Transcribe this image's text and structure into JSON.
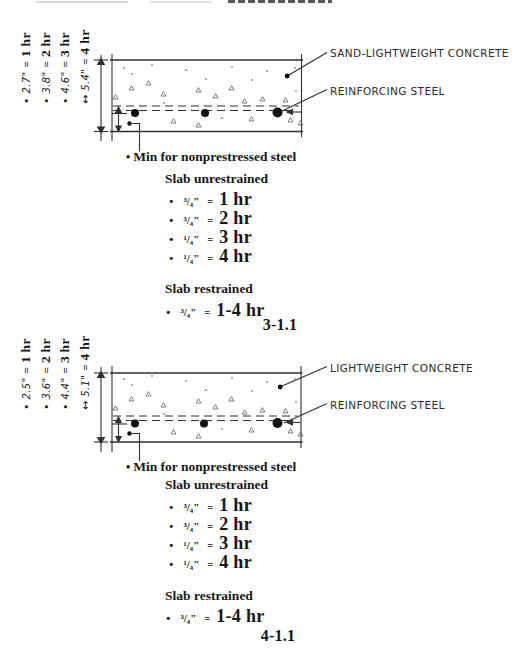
{
  "symbols": {
    "equals": "=",
    "bullet": "•"
  },
  "figures": [
    {
      "material_label": "SAND-LIGHTWEIGHT CONCRETE",
      "steel_label": "REINFORCING STEEL",
      "thickness_ratings": [
        {
          "bullet": "•",
          "value": "2.7\"",
          "rating": "1 hr"
        },
        {
          "bullet": "•",
          "value": "3.8\"",
          "rating": "2 hr"
        },
        {
          "bullet": "•",
          "value": "4.6\"",
          "rating": "3 hr"
        },
        {
          "bullet": "↔",
          "value": "5.4\"",
          "rating": "4 hr"
        }
      ],
      "cover_note": "Min for nonprestressed steel",
      "unrestrained_heading": "Slab unrestrained",
      "unrestrained_items": [
        {
          "cover": "³/₄\"",
          "rating": "1 hr"
        },
        {
          "cover": "³/₄\"",
          "rating": "2 hr"
        },
        {
          "cover": "¹/₄\"",
          "rating": "3 hr"
        },
        {
          "cover": "¹/₄\"",
          "rating": "4 hr"
        }
      ],
      "restrained_heading": "Slab restrained",
      "restrained_items": [
        {
          "cover": "³/₄\"",
          "rating": "1-4 hr"
        }
      ],
      "figure_number": "3-1.1"
    },
    {
      "material_label": "LIGHTWEIGHT CONCRETE",
      "steel_label": "REINFORCING STEEL",
      "thickness_ratings": [
        {
          "bullet": "•",
          "value": "2.5\"",
          "rating": "1 hr"
        },
        {
          "bullet": "•",
          "value": "3.6\"",
          "rating": "2 hr"
        },
        {
          "bullet": "•",
          "value": "4.4\"",
          "rating": "3 hr"
        },
        {
          "bullet": "↔",
          "value": "5.1\"",
          "rating": "4 hr"
        }
      ],
      "cover_note": "Min for nonprestressed steel",
      "unrestrained_heading": "Slab unrestrained",
      "unrestrained_items": [
        {
          "cover": "³/₄\"",
          "rating": "1 hr"
        },
        {
          "cover": "³/₄\"",
          "rating": "2 hr"
        },
        {
          "cover": "¹/₄\"",
          "rating": "3 hr"
        },
        {
          "cover": "¹/₄\"",
          "rating": "4 hr"
        }
      ],
      "restrained_heading": "Slab restrained",
      "restrained_items": [
        {
          "cover": "³/₄\"",
          "rating": "1-4 hr"
        }
      ],
      "figure_number": "4-1.1"
    }
  ]
}
